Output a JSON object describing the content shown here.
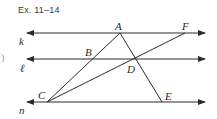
{
  "figure": {
    "caption": "Ex. 11–14",
    "edge_glyph": ")",
    "lines": [
      {
        "name": "k",
        "label": "k",
        "y": 33
      },
      {
        "name": "l",
        "label": "ℓ",
        "y": 59
      },
      {
        "name": "n",
        "label": "n",
        "y": 102
      }
    ],
    "points": {
      "A": {
        "label": "A",
        "x": 120,
        "y": 33
      },
      "F": {
        "label": "F",
        "x": 185,
        "y": 33
      },
      "B": {
        "label": "B",
        "x": 93,
        "y": 59
      },
      "D": {
        "label": "D",
        "x": 135,
        "y": 59
      },
      "C": {
        "label": "C",
        "x": 47,
        "y": 102
      },
      "E": {
        "label": "E",
        "x": 162,
        "y": 102
      }
    },
    "segments": [
      "CA",
      "AE",
      "CF"
    ],
    "colors": {
      "stroke": "#2b2b2b",
      "text": "#2a2a2a"
    }
  }
}
